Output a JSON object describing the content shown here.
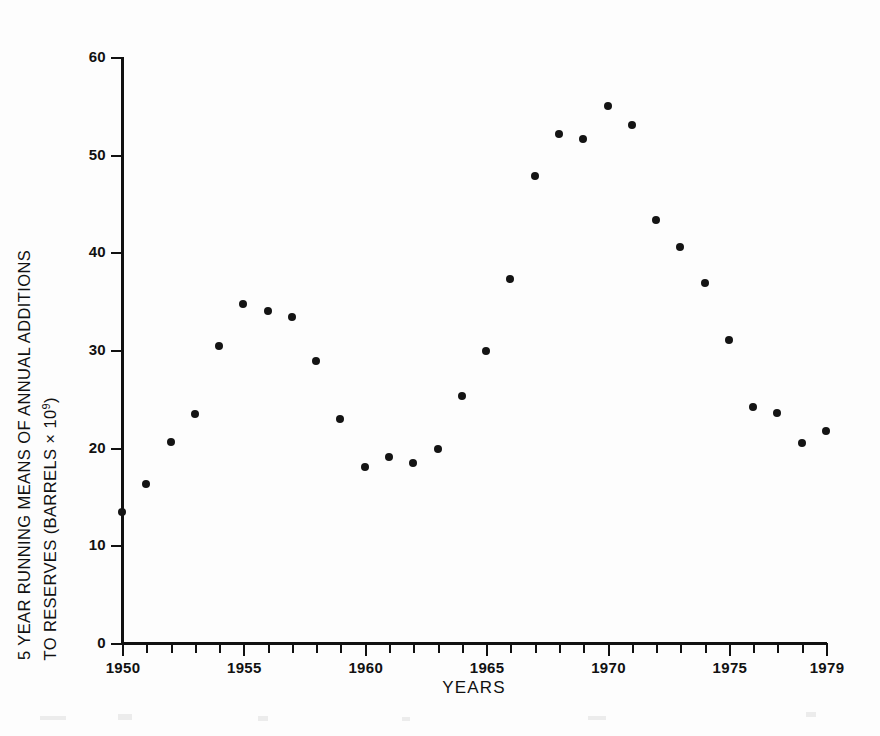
{
  "chart_data": {
    "type": "scatter",
    "title": "",
    "xlabel": "YEARS",
    "ylabel": "5 YEAR RUNNING MEANS OF ANNUAL ADDITIONS TO RESERVES (BARRELS × 10⁹)",
    "ylabel_line1": "5 YEAR RUNNING MEANS OF ANNUAL ADDITIONS",
    "ylabel_line2_pre": "TO RESERVES (BARRELS × 10",
    "ylabel_line2_sup": "9",
    "ylabel_line2_post": ")",
    "xlim": [
      1950,
      1979
    ],
    "ylim": [
      0,
      60
    ],
    "grid": false,
    "legend": null,
    "marker": "filled-circle",
    "marker_color": "#141414",
    "axis_color": "#111111",
    "background": "#ffffff",
    "x_ticks_major": [
      1950,
      1955,
      1960,
      1965,
      1970,
      1975,
      1979
    ],
    "x_tick_labels": [
      "1950",
      "1955",
      "1960",
      "1965",
      "1970",
      "1975",
      "1979"
    ],
    "x_tick_step_minor": 1,
    "y_ticks": [
      0,
      10,
      20,
      30,
      40,
      50,
      60
    ],
    "y_tick_labels": [
      "0",
      "10",
      "20",
      "30",
      "40",
      "50",
      "60"
    ],
    "x": [
      1950,
      1951,
      1952,
      1953,
      1954,
      1955,
      1956,
      1957,
      1958,
      1959,
      1960,
      1961,
      1962,
      1963,
      1964,
      1965,
      1966,
      1967,
      1968,
      1969,
      1970,
      1971,
      1972,
      1973,
      1974,
      1975,
      1976,
      1977,
      1978,
      1979
    ],
    "values": [
      13.4,
      16.3,
      20.6,
      23.4,
      30.4,
      34.7,
      34.0,
      33.4,
      28.9,
      22.9,
      18.0,
      19.0,
      18.4,
      19.9,
      25.3,
      29.9,
      37.3,
      47.8,
      52.1,
      51.6,
      55.0,
      53.0,
      43.3,
      40.5,
      36.9,
      31.0,
      24.2,
      23.6,
      20.5,
      21.7
    ],
    "points": [
      {
        "x": 1950,
        "y": 13.4
      },
      {
        "x": 1951,
        "y": 16.3
      },
      {
        "x": 1952,
        "y": 20.6
      },
      {
        "x": 1953,
        "y": 23.4
      },
      {
        "x": 1954,
        "y": 30.4
      },
      {
        "x": 1955,
        "y": 34.7
      },
      {
        "x": 1956,
        "y": 34.0
      },
      {
        "x": 1957,
        "y": 33.4
      },
      {
        "x": 1958,
        "y": 28.9
      },
      {
        "x": 1959,
        "y": 22.9
      },
      {
        "x": 1960,
        "y": 18.0
      },
      {
        "x": 1961,
        "y": 19.0
      },
      {
        "x": 1962,
        "y": 18.4
      },
      {
        "x": 1963,
        "y": 19.9
      },
      {
        "x": 1964,
        "y": 25.3
      },
      {
        "x": 1965,
        "y": 29.9
      },
      {
        "x": 1966,
        "y": 37.3
      },
      {
        "x": 1967,
        "y": 47.8
      },
      {
        "x": 1968,
        "y": 52.1
      },
      {
        "x": 1969,
        "y": 51.6
      },
      {
        "x": 1970,
        "y": 55.0
      },
      {
        "x": 1971,
        "y": 53.0
      },
      {
        "x": 1972,
        "y": 43.3
      },
      {
        "x": 1973,
        "y": 40.5
      },
      {
        "x": 1974,
        "y": 36.9
      },
      {
        "x": 1975,
        "y": 31.0
      },
      {
        "x": 1976,
        "y": 24.2
      },
      {
        "x": 1977,
        "y": 23.6
      },
      {
        "x": 1978,
        "y": 20.5
      },
      {
        "x": 1979,
        "y": 21.7
      }
    ]
  }
}
